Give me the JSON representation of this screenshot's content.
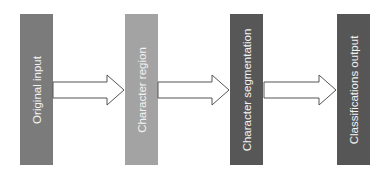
{
  "diagram": {
    "type": "flowchart",
    "direction": "left-to-right",
    "nodes": [
      {
        "id": "n1",
        "label": "Original input",
        "color": "#7b7b7b",
        "x": 20
      },
      {
        "id": "n2",
        "label": "Character region",
        "color": "#a3a3a3",
        "x": 125
      },
      {
        "id": "n3",
        "label": "Character segmentation",
        "color": "#575757",
        "x": 230
      },
      {
        "id": "n4",
        "label": "Classifications output",
        "color": "#565656",
        "x": 337
      }
    ],
    "edges": [
      {
        "from": "n1",
        "to": "n2",
        "style": "block-arrow"
      },
      {
        "from": "n2",
        "to": "n3",
        "style": "block-arrow"
      },
      {
        "from": "n3",
        "to": "n4",
        "style": "block-arrow"
      }
    ]
  }
}
